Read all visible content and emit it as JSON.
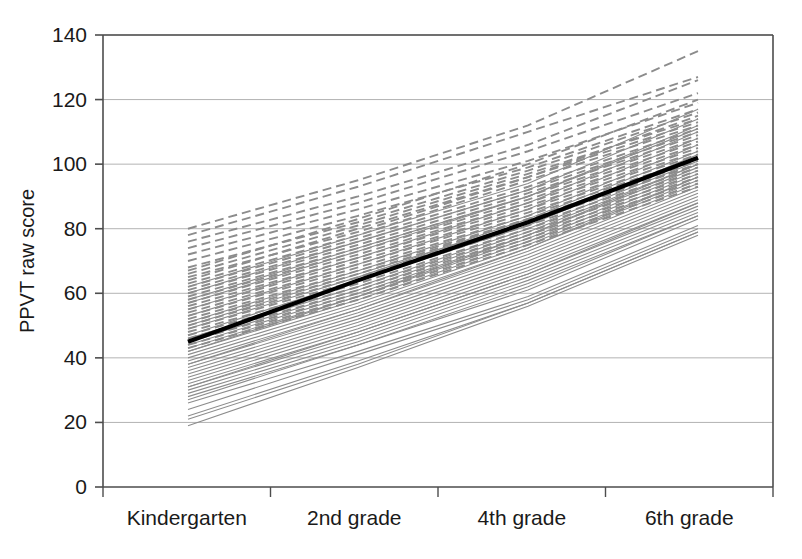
{
  "chart_data": {
    "type": "line",
    "title": "",
    "subtitle": "",
    "xlabel": "",
    "ylabel": "PPVT raw score",
    "categories": [
      "Kindergarten",
      "2nd grade",
      "4th grade",
      "6th grade"
    ],
    "x": [
      0,
      1,
      2,
      3
    ],
    "ylim": [
      0,
      140
    ],
    "yticks": [
      0,
      20,
      40,
      60,
      80,
      100,
      120,
      140
    ],
    "ytick_labels": [
      "0",
      "20",
      "40",
      "60",
      "80",
      "100",
      "120",
      "140"
    ],
    "grid": "horizontal",
    "legend": "none",
    "annotations": [],
    "mean_series": {
      "name": "Mean trajectory",
      "style": "bold-solid",
      "color": "#000000",
      "values": [
        45,
        64,
        82,
        102
      ]
    },
    "series": [
      {
        "name": "s01",
        "style": "dashed",
        "values": [
          80,
          95,
          112,
          135
        ]
      },
      {
        "name": "s02",
        "style": "dashed",
        "values": [
          78,
          93,
          110,
          127
        ]
      },
      {
        "name": "s03",
        "style": "dashed",
        "values": [
          76,
          90,
          106,
          126
        ]
      },
      {
        "name": "s04",
        "style": "dashed",
        "values": [
          74,
          88,
          104,
          122
        ]
      },
      {
        "name": "s05",
        "style": "dashed",
        "values": [
          72,
          86,
          101,
          119
        ]
      },
      {
        "name": "s06",
        "style": "dashed",
        "values": [
          70,
          84,
          99,
          117
        ]
      },
      {
        "name": "s07",
        "style": "dashed",
        "values": [
          68,
          82,
          98,
          116
        ]
      },
      {
        "name": "s08",
        "style": "dashed",
        "values": [
          66,
          81,
          97,
          114
        ]
      },
      {
        "name": "s09",
        "style": "dashed",
        "values": [
          64,
          80,
          96,
          113
        ]
      },
      {
        "name": "s10",
        "style": "dashed",
        "values": [
          63,
          78,
          95,
          112
        ]
      },
      {
        "name": "s11",
        "style": "dashed",
        "values": [
          62,
          77,
          93,
          111
        ]
      },
      {
        "name": "s12",
        "style": "dashed",
        "values": [
          61,
          76,
          92,
          110
        ]
      },
      {
        "name": "s13",
        "style": "dashed",
        "values": [
          60,
          75,
          91,
          109
        ]
      },
      {
        "name": "s14",
        "style": "dashed",
        "values": [
          59,
          74,
          90,
          108
        ]
      },
      {
        "name": "s15",
        "style": "dashed",
        "values": [
          58,
          73,
          89,
          107
        ]
      },
      {
        "name": "s16",
        "style": "dashed",
        "values": [
          57,
          72,
          88,
          106
        ]
      },
      {
        "name": "s17",
        "style": "dashed",
        "values": [
          56,
          71,
          87,
          105
        ]
      },
      {
        "name": "s18",
        "style": "dashed",
        "values": [
          55,
          70,
          86,
          104
        ]
      },
      {
        "name": "s19",
        "style": "dashed",
        "values": [
          54,
          69,
          85,
          103
        ]
      },
      {
        "name": "s20",
        "style": "dashed",
        "values": [
          53,
          68,
          84,
          102
        ]
      },
      {
        "name": "s21",
        "style": "dashed",
        "values": [
          52,
          67,
          83,
          101
        ]
      },
      {
        "name": "s22",
        "style": "dashed",
        "values": [
          51,
          66,
          83,
          100
        ]
      },
      {
        "name": "s23",
        "style": "dashed",
        "values": [
          50,
          65,
          82,
          100
        ]
      },
      {
        "name": "s24",
        "style": "dashed",
        "values": [
          49,
          64,
          81,
          99
        ]
      },
      {
        "name": "s25",
        "style": "dashed",
        "values": [
          48,
          63,
          80,
          98
        ]
      },
      {
        "name": "s26",
        "style": "dashed",
        "values": [
          47,
          62,
          79,
          97
        ]
      },
      {
        "name": "s27",
        "style": "dashed",
        "values": [
          46,
          61,
          78,
          96
        ]
      },
      {
        "name": "s28",
        "style": "dashed",
        "values": [
          45,
          60,
          77,
          95
        ]
      },
      {
        "name": "s29",
        "style": "dashed",
        "values": [
          44,
          59,
          76,
          94
        ]
      },
      {
        "name": "s30",
        "style": "dashed",
        "values": [
          43,
          58,
          75,
          93
        ]
      },
      {
        "name": "s31",
        "style": "solid",
        "values": [
          62,
          78,
          94,
          117
        ]
      },
      {
        "name": "s32",
        "style": "solid",
        "values": [
          58,
          74,
          90,
          112
        ]
      },
      {
        "name": "s33",
        "style": "solid",
        "values": [
          55,
          71,
          88,
          110
        ]
      },
      {
        "name": "s34",
        "style": "solid",
        "values": [
          53,
          69,
          86,
          108
        ]
      },
      {
        "name": "s35",
        "style": "solid",
        "values": [
          51,
          67,
          84,
          106
        ]
      },
      {
        "name": "s36",
        "style": "solid",
        "values": [
          49,
          65,
          83,
          104
        ]
      },
      {
        "name": "s37",
        "style": "solid",
        "values": [
          47,
          64,
          81,
          103
        ]
      },
      {
        "name": "s38",
        "style": "solid",
        "values": [
          46,
          62,
          80,
          101
        ]
      },
      {
        "name": "s39",
        "style": "solid",
        "values": [
          45,
          61,
          79,
          100
        ]
      },
      {
        "name": "s40",
        "style": "solid",
        "values": [
          44,
          60,
          78,
          99
        ]
      },
      {
        "name": "s41",
        "style": "solid",
        "values": [
          43,
          59,
          77,
          98
        ]
      },
      {
        "name": "s42",
        "style": "solid",
        "values": [
          42,
          58,
          76,
          97
        ]
      },
      {
        "name": "s43",
        "style": "solid",
        "values": [
          41,
          57,
          75,
          96
        ]
      },
      {
        "name": "s44",
        "style": "solid",
        "values": [
          40,
          56,
          74,
          95
        ]
      },
      {
        "name": "s45",
        "style": "solid",
        "values": [
          39,
          55,
          73,
          94
        ]
      },
      {
        "name": "s46",
        "style": "solid",
        "values": [
          38,
          54,
          72,
          93
        ]
      },
      {
        "name": "s47",
        "style": "solid",
        "values": [
          37,
          53,
          71,
          92
        ]
      },
      {
        "name": "s48",
        "style": "solid",
        "values": [
          36,
          52,
          70,
          91
        ]
      },
      {
        "name": "s49",
        "style": "solid",
        "values": [
          35,
          51,
          69,
          90
        ]
      },
      {
        "name": "s50",
        "style": "solid",
        "values": [
          34,
          50,
          68,
          89
        ]
      },
      {
        "name": "s51",
        "style": "solid",
        "values": [
          33,
          49,
          67,
          88
        ]
      },
      {
        "name": "s52",
        "style": "solid",
        "values": [
          32,
          48,
          66,
          87
        ]
      },
      {
        "name": "s53",
        "style": "solid",
        "values": [
          31,
          47,
          65,
          86
        ]
      },
      {
        "name": "s54",
        "style": "solid",
        "values": [
          30,
          46,
          64,
          85
        ]
      },
      {
        "name": "s55",
        "style": "solid",
        "values": [
          29,
          45,
          63,
          84
        ]
      },
      {
        "name": "s56",
        "style": "solid",
        "values": [
          28,
          44,
          61,
          83
        ]
      },
      {
        "name": "s57",
        "style": "solid",
        "values": [
          26,
          42,
          59,
          81
        ]
      },
      {
        "name": "s58",
        "style": "solid",
        "values": [
          24,
          41,
          58,
          80
        ]
      },
      {
        "name": "s59",
        "style": "solid",
        "values": [
          22,
          39,
          57,
          79
        ]
      },
      {
        "name": "s60",
        "style": "solid",
        "values": [
          19,
          37,
          56,
          78
        ]
      },
      {
        "name": "s61",
        "style": "dashed",
        "values": [
          67,
          83,
          100,
          120
        ]
      },
      {
        "name": "s62",
        "style": "dashed",
        "values": [
          65,
          79,
          96,
          115
        ]
      },
      {
        "name": "s63",
        "style": "solid",
        "values": [
          60,
          76,
          92,
          114
        ]
      },
      {
        "name": "s64",
        "style": "solid",
        "values": [
          57,
          73,
          90,
          111
        ]
      },
      {
        "name": "s65",
        "style": "solid",
        "values": [
          50,
          66,
          82,
          102
        ]
      },
      {
        "name": "s66",
        "style": "solid",
        "values": [
          42,
          59,
          78,
          100
        ]
      },
      {
        "name": "s67",
        "style": "solid",
        "values": [
          38,
          55,
          74,
          96
        ]
      },
      {
        "name": "s68",
        "style": "solid",
        "values": [
          31,
          48,
          66,
          88
        ]
      },
      {
        "name": "s69",
        "style": "solid",
        "values": [
          27,
          44,
          62,
          84
        ]
      },
      {
        "name": "s70",
        "style": "solid",
        "values": [
          21,
          38,
          57,
          79
        ]
      }
    ]
  },
  "axis_colors": {
    "axis_line": "#4d4d4d",
    "gridline": "#b3b3b3",
    "individual_line": "#8c8c8c",
    "mean_line": "#000000",
    "text": "#1a1a1a"
  },
  "geometry": {
    "plot_left": 103,
    "plot_right": 773,
    "plot_top": 35,
    "plot_bottom": 487,
    "data_left": 188,
    "data_right": 698
  }
}
